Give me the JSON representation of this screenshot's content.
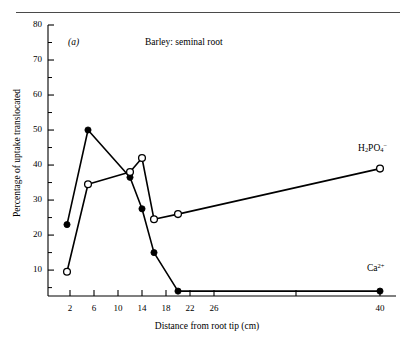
{
  "figure": {
    "panel_label": "(a)",
    "title": "Barley: seminal root",
    "xlabel": "Distance from root tip (cm)",
    "ylabel": "Percentage of uptake translocated"
  },
  "series_labels": {
    "phosphate_base": "H",
    "phosphate_sub1": "2",
    "phosphate_mid": "PO",
    "phosphate_sub2": "4",
    "phosphate_sup": "−",
    "calcium_base": "Ca",
    "calcium_sup": "2+"
  },
  "chart_data": {
    "type": "line",
    "title": "Barley: seminal root",
    "xlabel": "Distance from root tip (cm)",
    "ylabel": "Percentage of uptake translocated",
    "xlim": [
      0,
      42
    ],
    "ylim": [
      0,
      80
    ],
    "grid": false,
    "legend": "inline-right",
    "annotations": [
      "(a)"
    ],
    "x_ticks": [
      2,
      6,
      10,
      14,
      18,
      22,
      26,
      30,
      40
    ],
    "x_tick_labels": [
      "2",
      "6",
      "10",
      "14",
      "18",
      "22",
      "26",
      "",
      "40"
    ],
    "x_axis_note": "scale compressed between 26 and 40",
    "y_ticks": [
      10,
      20,
      30,
      40,
      50,
      60,
      70,
      80
    ],
    "y_tick_labels": [
      "10",
      "20",
      "30",
      "40",
      "50",
      "60",
      "70",
      "80"
    ],
    "y_minor_ticks": [
      5,
      15,
      25,
      35,
      45,
      55,
      65,
      75
    ],
    "series": [
      {
        "name": "Ca2+",
        "marker": "filled-circle",
        "x": [
          1.5,
          5,
          12,
          14,
          16,
          20,
          40
        ],
        "values": [
          23,
          50,
          36.5,
          27.5,
          15,
          4,
          4
        ]
      },
      {
        "name": "H2PO4-",
        "marker": "open-circle",
        "x": [
          1.5,
          5,
          12,
          14,
          16,
          20,
          40
        ],
        "values": [
          9.5,
          34.5,
          38,
          42,
          24.5,
          26,
          39
        ]
      }
    ]
  },
  "colors": {
    "ink": "#000000",
    "rule": "#4a4a4a",
    "background": "#ffffff"
  }
}
